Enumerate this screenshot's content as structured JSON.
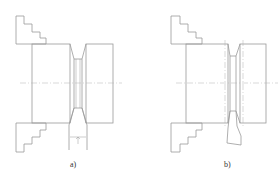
{
  "figure": {
    "panels": [
      {
        "id": "a",
        "label": "a)",
        "description": "Grooving with straight plunge tool and symmetric V groove"
      },
      {
        "id": "b",
        "label": "b)",
        "description": "Grooving with angled tool and offset groove"
      }
    ]
  },
  "colors": {
    "line": "#9a9a9a",
    "dash": "#b0b0b0",
    "background": "#ffffff"
  }
}
